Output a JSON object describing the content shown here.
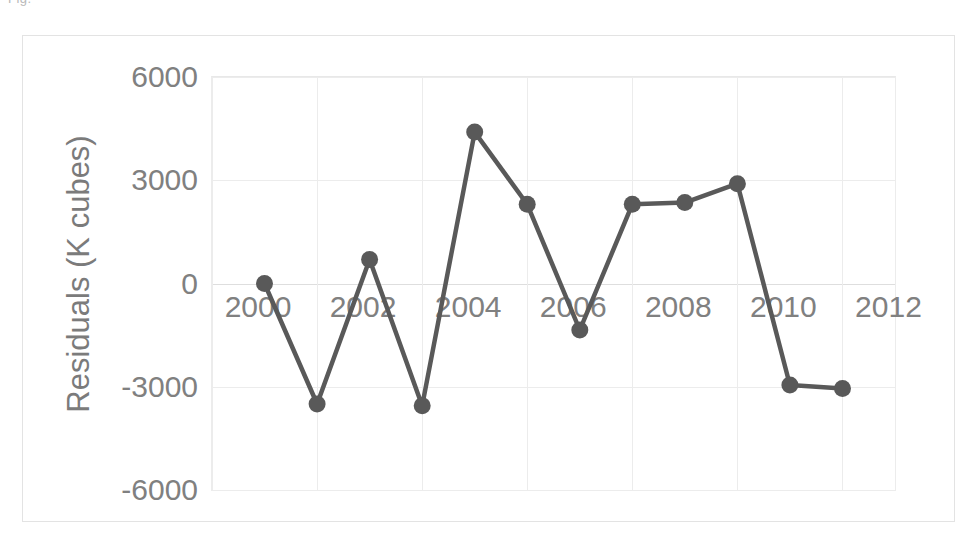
{
  "top_fragment": "Fig.",
  "chart_data": {
    "type": "line",
    "title": "",
    "xlabel": "",
    "ylabel": "Residuals (K cubes)",
    "x": [
      2001,
      2002,
      2003,
      2004,
      2005,
      2006,
      2007,
      2008,
      2009,
      2010,
      2011,
      2012
    ],
    "values": [
      0,
      -3500,
      700,
      -3550,
      4400,
      2300,
      -1350,
      2300,
      2350,
      2900,
      -2950,
      -3050
    ],
    "series": [
      {
        "name": "Residuals",
        "values": [
          0,
          -3500,
          700,
          -3550,
          4400,
          2300,
          -1350,
          2300,
          2350,
          2900,
          -2950,
          -3050
        ]
      }
    ],
    "xlim": [
      2000,
      2013
    ],
    "ylim": [
      -6000,
      6000
    ],
    "xticks": [
      "2000",
      "2002",
      "2004",
      "2006",
      "2008",
      "2010",
      "2012"
    ],
    "xtick_values": [
      2000,
      2002,
      2004,
      2006,
      2008,
      2010,
      2012
    ],
    "yticks": [
      "6000",
      "3000",
      "0",
      "-3000",
      "-6000"
    ],
    "ytick_values": [
      6000,
      3000,
      0,
      -3000,
      -6000
    ],
    "grid": true,
    "legend": false,
    "legend_position": "none",
    "marker": "circle",
    "line_color": "#595959",
    "marker_color": "#595959",
    "grid_color": "#ececec",
    "tick_label_color": "#808080",
    "axis_title_color": "#7b7b7b",
    "background_color": "#ffffff"
  },
  "axis": {
    "y_title": "Residuals (K cubes)"
  }
}
